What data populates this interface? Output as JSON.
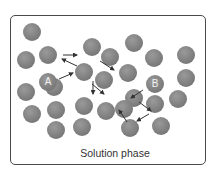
{
  "diagram": {
    "caption": "Solution phase",
    "labels": {
      "A": "A",
      "B": "B"
    },
    "colors": {
      "particle": "#808080",
      "frame": "#4a4a4a",
      "arrow": "#333333",
      "background": "#ffffff"
    },
    "particles": [
      {
        "x": 32,
        "y": 32
      },
      {
        "x": 26,
        "y": 60
      },
      {
        "x": 48,
        "y": 55
      },
      {
        "x": 92,
        "y": 47
      },
      {
        "x": 110,
        "y": 57
      },
      {
        "x": 134,
        "y": 43
      },
      {
        "x": 154,
        "y": 58
      },
      {
        "x": 186,
        "y": 55
      },
      {
        "x": 84,
        "y": 72
      },
      {
        "x": 128,
        "y": 73
      },
      {
        "x": 186,
        "y": 78
      },
      {
        "x": 26,
        "y": 92
      },
      {
        "x": 54,
        "y": 87
      },
      {
        "x": 104,
        "y": 80
      },
      {
        "x": 134,
        "y": 98
      },
      {
        "x": 178,
        "y": 99
      },
      {
        "x": 32,
        "y": 114
      },
      {
        "x": 56,
        "y": 110
      },
      {
        "x": 84,
        "y": 106
      },
      {
        "x": 106,
        "y": 111
      },
      {
        "x": 124,
        "y": 109
      },
      {
        "x": 155,
        "y": 104
      },
      {
        "x": 56,
        "y": 130
      },
      {
        "x": 82,
        "y": 127
      },
      {
        "x": 130,
        "y": 128
      },
      {
        "x": 161,
        "y": 126
      }
    ],
    "labeled": [
      {
        "label": "A",
        "x": 48,
        "y": 82
      },
      {
        "label": "B",
        "x": 155,
        "y": 84
      }
    ],
    "arrows": [
      {
        "x1": 63,
        "y1": 55,
        "x2": 77,
        "y2": 55
      },
      {
        "x1": 77,
        "y1": 66,
        "x2": 62,
        "y2": 59
      },
      {
        "x1": 59,
        "y1": 79,
        "x2": 73,
        "y2": 73
      },
      {
        "x1": 100,
        "y1": 61,
        "x2": 114,
        "y2": 70
      },
      {
        "x1": 93,
        "y1": 81,
        "x2": 93,
        "y2": 94
      },
      {
        "x1": 92,
        "y1": 84,
        "x2": 104,
        "y2": 94
      },
      {
        "x1": 143,
        "y1": 90,
        "x2": 131,
        "y2": 98
      },
      {
        "x1": 139,
        "y1": 102,
        "x2": 151,
        "y2": 111
      },
      {
        "x1": 149,
        "y1": 114,
        "x2": 137,
        "y2": 121
      },
      {
        "x1": 127,
        "y1": 122,
        "x2": 119,
        "y2": 110
      }
    ]
  }
}
